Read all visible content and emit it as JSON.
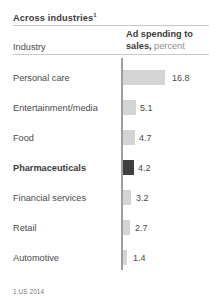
{
  "title": {
    "text": "Across industries",
    "footnote_marker": "1"
  },
  "columns": {
    "industry_header": "Industry",
    "value_header_bold": "Ad spending to sales,",
    "value_header_unit": "percent"
  },
  "footnote": "1 US 2014",
  "colors": {
    "bar": "#d4d4d4",
    "bar_highlight": "#3f3f3f",
    "axis": "#9e9e9e",
    "rule": "#c9c9c9",
    "text": "#4a4a4a",
    "text_muted": "#8f8f8f"
  },
  "chart_data": {
    "type": "bar",
    "title": "Across industries",
    "subtitle": "",
    "xlabel": "Ad spending to sales, percent",
    "ylabel": "Industry",
    "orientation": "horizontal",
    "grid": false,
    "legend": "none",
    "xlim": [
      0,
      16.8
    ],
    "unit": "percent",
    "footnote": "1 US 2014",
    "highlight_category": "Pharmaceuticals",
    "categories": [
      "Personal care",
      "Entertainment/media",
      "Food",
      "Pharmaceuticals",
      "Financial services",
      "Retail",
      "Automotive"
    ],
    "values": [
      16.8,
      5.1,
      4.7,
      4.2,
      3.2,
      2.7,
      1.4
    ],
    "labels": [
      "16.8",
      "5.1",
      "4.7",
      "4.2",
      "3.2",
      "2.7",
      "1.4"
    ],
    "highlighted": [
      false,
      false,
      false,
      true,
      false,
      false,
      false
    ]
  },
  "rows": [
    {
      "label": "Personal care",
      "value": "16.8",
      "top": 72,
      "bar_width": 42.0,
      "value_left": 172.0,
      "highlight": false
    },
    {
      "label": "Entertainment/media",
      "value": "5.1",
      "top": 102,
      "bar_width": 12.8,
      "value_left": 140.0,
      "highlight": false
    },
    {
      "label": "Food",
      "value": "4.7",
      "top": 132,
      "bar_width": 11.8,
      "value_left": 139.0,
      "highlight": false
    },
    {
      "label": "Pharmaceuticals",
      "value": "4.2",
      "top": 162,
      "bar_width": 10.5,
      "value_left": 138.0,
      "highlight": true
    },
    {
      "label": "Financial services",
      "value": "3.2",
      "top": 192,
      "bar_width": 8.0,
      "value_left": 136.0,
      "highlight": false
    },
    {
      "label": "Retail",
      "value": "2.7",
      "top": 222,
      "bar_width": 6.8,
      "value_left": 135.0,
      "highlight": false
    },
    {
      "label": "Automotive",
      "value": "1.4",
      "top": 252,
      "bar_width": 3.5,
      "value_left": 133.0,
      "highlight": false
    }
  ]
}
